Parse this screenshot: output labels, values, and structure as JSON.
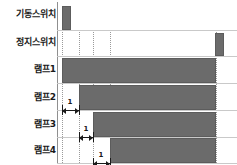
{
  "diagram": {
    "type": "timing-diagram",
    "colors": {
      "bar_fill": "#6b6b6b",
      "bar_stroke": "#5c5c5c",
      "baseline": "#c9c9c9",
      "gridline": "#9a9a9a",
      "axis": "#8f8f8f",
      "text": "#1a1a1a",
      "background": "#ffffff"
    },
    "rows": [
      {
        "label": "기동스위치",
        "track_id": "start-switch",
        "label_top": 10,
        "baseline_y": 30,
        "signals": [
          {
            "x": 62,
            "width": 9,
            "height": 24
          }
        ]
      },
      {
        "label": "정지스위치",
        "track_id": "stop-switch",
        "label_top": 38,
        "baseline_y": 56,
        "signals": [
          {
            "x": 215,
            "width": 9,
            "height": 23
          }
        ]
      },
      {
        "label": "램프1",
        "track_id": "lamp-1",
        "label_top": 65,
        "baseline_y": 83,
        "signals": [
          {
            "x": 62,
            "width": 154,
            "height": 25
          }
        ]
      },
      {
        "label": "램프2",
        "track_id": "lamp-2",
        "label_top": 93,
        "baseline_y": 110,
        "signals": [
          {
            "x": 79,
            "width": 137,
            "height": 25
          }
        ]
      },
      {
        "label": "램프3",
        "track_id": "lamp-3",
        "label_top": 120,
        "baseline_y": 137,
        "signals": [
          {
            "x": 93,
            "width": 123,
            "height": 25
          }
        ]
      },
      {
        "label": "램프4",
        "track_id": "lamp-4",
        "label_top": 146,
        "baseline_y": 163,
        "signals": [
          {
            "x": 110,
            "width": 106,
            "height": 25
          }
        ]
      }
    ],
    "gridlines": [
      {
        "x": 62,
        "top": 30,
        "height": 133
      },
      {
        "x": 79,
        "top": 30,
        "height": 133
      },
      {
        "x": 93,
        "top": 30,
        "height": 133
      },
      {
        "x": 110,
        "top": 30,
        "height": 133
      },
      {
        "x": 216,
        "top": 30,
        "height": 133
      }
    ],
    "axis_vertical": {
      "x": 57,
      "top": 2,
      "height": 161
    },
    "intervals": [
      {
        "label": "1",
        "track_id": "lamp-2",
        "from_x": 62,
        "to_x": 79,
        "line_y": 110,
        "text_x": 70,
        "text_y": 99
      },
      {
        "label": "1",
        "track_id": "lamp-3",
        "from_x": 79,
        "to_x": 93,
        "line_y": 137,
        "text_x": 86,
        "text_y": 126
      },
      {
        "label": "1",
        "track_id": "lamp-4",
        "from_x": 93,
        "to_x": 110,
        "line_y": 163,
        "text_x": 101,
        "text_y": 152
      }
    ],
    "label_font_size": 9
  }
}
